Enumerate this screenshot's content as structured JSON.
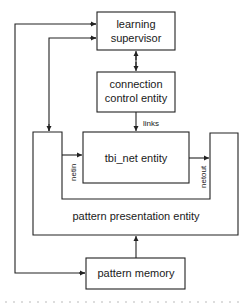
{
  "diagram": {
    "nodes": {
      "learning_supervisor": {
        "line1": "learning",
        "line2": "supervisor"
      },
      "connection_control": {
        "line1": "connection",
        "line2": "control entity"
      },
      "tbi_net": {
        "label": "tbi_net entity"
      },
      "pattern_presentation": {
        "label": "pattern presentation entity"
      },
      "pattern_memory": {
        "label": "pattern memory"
      }
    },
    "edge_labels": {
      "links": "links",
      "netin": "netin",
      "netout": "netout"
    },
    "colors": {
      "stroke": "#222222",
      "background": "#ffffff"
    }
  }
}
